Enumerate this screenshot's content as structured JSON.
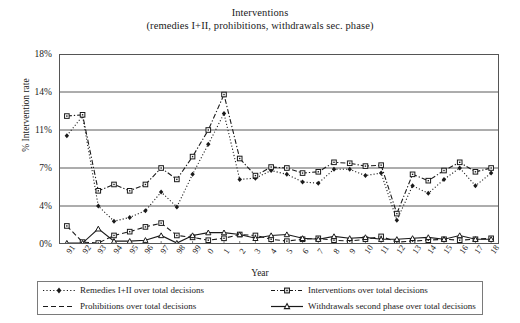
{
  "chart_data": {
    "type": "line",
    "title": "Interventions",
    "subtitle": "(remedies I+II, prohibitions, withdrawals sec. phase)",
    "xlabel": "Year",
    "ylabel": "% Intervention rate",
    "ylim": [
      0,
      18
    ],
    "yticks": [
      0,
      4,
      7,
      11,
      14,
      18
    ],
    "ytick_labels": [
      "0%",
      "4%",
      "7%",
      "11%",
      "14%",
      "18%"
    ],
    "grid": true,
    "legend_position": "bottom",
    "categories": [
      "91",
      "92",
      "93",
      "94",
      "95",
      "96",
      "97",
      "98",
      "99",
      "0",
      "1",
      "2",
      "3",
      "4",
      "5",
      "6",
      "7",
      "8",
      "9",
      "10",
      "11",
      "12",
      "13",
      "14",
      "15",
      "16",
      "17",
      "18"
    ],
    "series": [
      {
        "name": "Remedies I+II over total decisions",
        "marker": "diamond",
        "line": "dotted",
        "values": [
          10.4,
          12.1,
          4.0,
          2.4,
          2.8,
          3.5,
          5.1,
          3.9,
          6.5,
          9.5,
          12.3,
          6.1,
          6.2,
          6.8,
          6.5,
          5.9,
          5.8,
          6.9,
          6.9,
          6.4,
          6.6,
          2.5,
          5.6,
          5.0,
          6.1,
          7.0,
          5.6,
          6.6
        ]
      },
      {
        "name": "Interventions over total decisions",
        "marker": "square",
        "line": "dashed-dot",
        "values": [
          12.1,
          12.2,
          5.2,
          5.7,
          5.2,
          5.7,
          7.0,
          6.1,
          8.2,
          11.0,
          13.8,
          8.0,
          6.4,
          7.1,
          7.0,
          6.6,
          6.7,
          7.6,
          7.5,
          7.2,
          7.3,
          3.2,
          6.5,
          6.0,
          6.8,
          7.6,
          6.7,
          7.0
        ]
      },
      {
        "name": "Prohibitions over total decisions",
        "marker": "square",
        "line": "dashed",
        "values": [
          1.9,
          0.2,
          0.1,
          0.9,
          1.3,
          1.8,
          2.2,
          0.9,
          0.7,
          0.4,
          0.6,
          1.0,
          0.9,
          0.5,
          0.3,
          0.5,
          0.6,
          0.4,
          0.3,
          0.5,
          0.8,
          0.2,
          0.3,
          0.4,
          0.5,
          0.4,
          0.5,
          0.6
        ]
      },
      {
        "name": "Withdrawals second phase over total decisions",
        "marker": "triangle",
        "line": "solid",
        "values": [
          0.1,
          0.1,
          1.6,
          0.3,
          0.3,
          0.4,
          0.9,
          0.1,
          0.9,
          1.2,
          1.2,
          1.0,
          0.6,
          0.9,
          1.0,
          0.6,
          0.5,
          0.8,
          0.6,
          0.7,
          0.5,
          0.5,
          0.6,
          0.7,
          0.5,
          0.9,
          0.5,
          0.5
        ]
      }
    ],
    "colors": {
      "ink": "#1a1a1a",
      "grid": "#5a5a5a",
      "frame": "#555555"
    }
  },
  "legend": {
    "items": [
      "Remedies I+II over total decisions",
      "Interventions over total decisions",
      "Prohibitions over total decisions",
      "Withdrawals second phase over total decisions"
    ]
  }
}
